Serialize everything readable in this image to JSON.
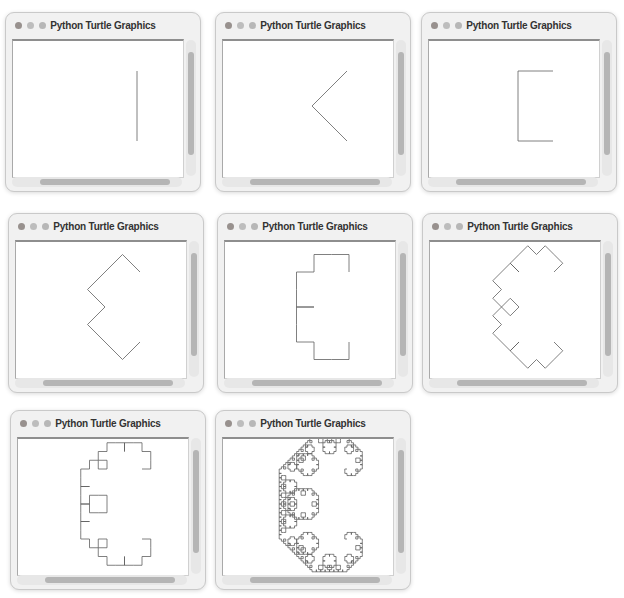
{
  "app": {
    "window_title": "Python Turtle Graphics",
    "window_count": 8
  },
  "colors": {
    "page_bg": "#ffffff",
    "window_chrome": "#f1f1f1",
    "window_border": "#c9c9c9",
    "titlebar_text": "#333333",
    "traffic_light_close": "#98918e",
    "traffic_light_minimize": "#bdbdbd",
    "traffic_light_zoom": "#b7b7b7",
    "canvas_bg": "#ffffff",
    "canvas_border_top": "#8e8e8e",
    "canvas_border_side": "#d0d0d0",
    "scrollbar_track": "#e7e7e7",
    "scrollbar_thumb": "#b5b5b5",
    "curve_stroke": "#5f5f5f"
  },
  "curve": {
    "type": "levy-c-curve",
    "start_point": [
      124,
      30
    ],
    "end_point": [
      124,
      100
    ],
    "stroke_width": 0.8
  },
  "windows": [
    {
      "index": 1,
      "curve_iteration": 0
    },
    {
      "index": 2,
      "curve_iteration": 1
    },
    {
      "index": 3,
      "curve_iteration": 2
    },
    {
      "index": 4,
      "curve_iteration": 3
    },
    {
      "index": 5,
      "curve_iteration": 4
    },
    {
      "index": 6,
      "curve_iteration": 5
    },
    {
      "index": 7,
      "curve_iteration": 6
    },
    {
      "index": 8,
      "curve_iteration": 10
    }
  ]
}
